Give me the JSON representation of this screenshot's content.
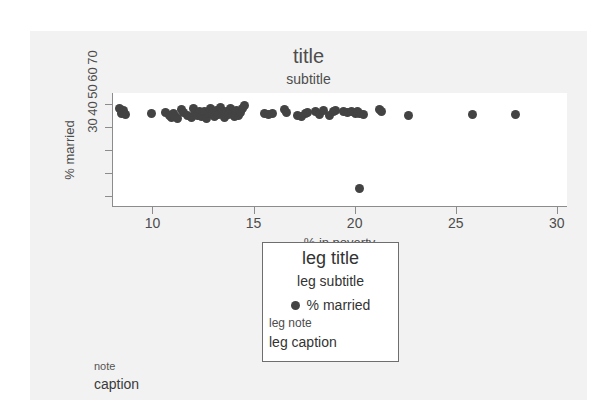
{
  "page": {
    "bleed_top_text": "              "
  },
  "chart_data": {
    "type": "scatter",
    "title": "title",
    "subtitle": "subtitle",
    "xlabel": "% in poverty",
    "ylabel": "% married",
    "xlim": [
      8.0,
      30.5
    ],
    "ylim": [
      25,
      75
    ],
    "grid": false,
    "xticks": [
      10,
      15,
      20,
      25,
      30
    ],
    "xtick_labels": [
      "10",
      "15",
      "20",
      "25",
      "30"
    ],
    "yticks": [
      30,
      40,
      50,
      60,
      70
    ],
    "ytick_labels": [
      "30",
      "40",
      "50",
      "60",
      "70"
    ],
    "legend": {
      "position": "below-plot-center",
      "title": "leg title",
      "subtitle": "leg subtitle",
      "note": "leg note",
      "caption": "leg caption",
      "entries": [
        {
          "label": "% married",
          "marker": "circle",
          "color": "#434343"
        }
      ]
    },
    "note": "note",
    "caption": "caption",
    "series": [
      {
        "name": "% married",
        "color": "#434343",
        "marker": "circle",
        "points": [
          [
            8.3,
            68.2
          ],
          [
            8.4,
            66.0
          ],
          [
            8.5,
            67.2
          ],
          [
            8.6,
            65.4
          ],
          [
            9.9,
            65.8
          ],
          [
            10.6,
            66.3
          ],
          [
            10.8,
            65.2
          ],
          [
            10.9,
            64.3
          ],
          [
            11.0,
            66.0
          ],
          [
            11.1,
            64.6
          ],
          [
            11.2,
            63.9
          ],
          [
            11.4,
            67.6
          ],
          [
            11.5,
            66.4
          ],
          [
            11.7,
            65.1
          ],
          [
            11.9,
            64.2
          ],
          [
            12.0,
            68.0
          ],
          [
            12.1,
            66.5
          ],
          [
            12.2,
            65.3
          ],
          [
            12.3,
            67.1
          ],
          [
            12.4,
            64.8
          ],
          [
            12.5,
            66.9
          ],
          [
            12.6,
            63.8
          ],
          [
            12.7,
            65.9
          ],
          [
            12.8,
            68.4
          ],
          [
            12.9,
            66.2
          ],
          [
            13.0,
            64.9
          ],
          [
            13.1,
            67.3
          ],
          [
            13.2,
            65.5
          ],
          [
            13.3,
            68.6
          ],
          [
            13.4,
            66.8
          ],
          [
            13.5,
            64.4
          ],
          [
            13.6,
            67.0
          ],
          [
            13.7,
            65.6
          ],
          [
            13.8,
            68.1
          ],
          [
            13.9,
            66.1
          ],
          [
            14.0,
            64.7
          ],
          [
            14.1,
            67.5
          ],
          [
            14.2,
            65.0
          ],
          [
            14.3,
            66.6
          ],
          [
            14.4,
            68.3
          ],
          [
            14.5,
            69.4
          ],
          [
            15.5,
            66.2
          ],
          [
            15.7,
            65.4
          ],
          [
            15.9,
            66.0
          ],
          [
            16.5,
            67.7
          ],
          [
            16.6,
            66.4
          ],
          [
            17.1,
            65.0
          ],
          [
            17.3,
            64.6
          ],
          [
            17.5,
            65.8
          ],
          [
            17.6,
            66.5
          ],
          [
            18.0,
            66.9
          ],
          [
            18.2,
            65.7
          ],
          [
            18.4,
            67.2
          ],
          [
            18.7,
            65.2
          ],
          [
            18.9,
            66.8
          ],
          [
            19.0,
            67.4
          ],
          [
            19.4,
            67.0
          ],
          [
            19.6,
            66.3
          ],
          [
            19.8,
            66.7
          ],
          [
            20.0,
            65.9
          ],
          [
            20.1,
            67.1
          ],
          [
            20.2,
            66.0
          ],
          [
            20.4,
            65.5
          ],
          [
            21.2,
            67.6
          ],
          [
            21.3,
            66.8
          ],
          [
            22.6,
            65.2
          ],
          [
            25.8,
            65.6
          ],
          [
            27.9,
            65.5
          ],
          [
            20.2,
            33.1
          ]
        ]
      }
    ]
  }
}
